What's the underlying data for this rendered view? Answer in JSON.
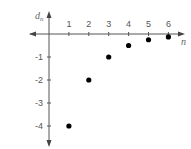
{
  "chart_data": {
    "type": "scatter",
    "title": "",
    "xlabel": "n",
    "ylabel": "d_n",
    "ylabel_main": "d",
    "ylabel_sub": "n",
    "x": [
      1,
      2,
      3,
      4,
      5,
      6
    ],
    "values": [
      -4,
      -2,
      -1,
      -0.5,
      -0.25,
      -0.125
    ],
    "x_ticks": [
      "1",
      "2",
      "3",
      "4",
      "5",
      "6"
    ],
    "y_ticks": [
      "-1",
      "-2",
      "-3",
      "-4"
    ],
    "xlim": [
      0,
      7
    ],
    "ylim": [
      -4.5,
      0.8
    ],
    "grid": false,
    "legend": null,
    "colors": {
      "axis": "#555555",
      "points": "#000000"
    }
  }
}
